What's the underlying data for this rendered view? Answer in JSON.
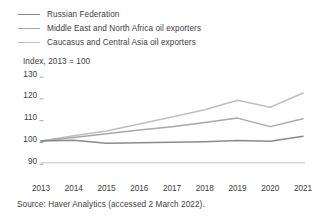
{
  "legend": {
    "position": "top-left",
    "items": [
      {
        "label": "Russian Federation",
        "color": "#8a8a8a"
      },
      {
        "label": "Middle East and North Africa oil exporters",
        "color": "#a8a8a8"
      },
      {
        "label": "Caucasus and Central Asia oil exporters",
        "color": "#bfbfbf"
      }
    ]
  },
  "source": {
    "text": "Source: Haver Analytics (accessed 2 March 2022)."
  },
  "chart_data": {
    "type": "line",
    "title": "Index,  2013 = 100",
    "xlabel": "",
    "ylabel": "",
    "x": [
      2013,
      2014,
      2015,
      2016,
      2017,
      2018,
      2019,
      2020,
      2021
    ],
    "categories": [
      "2013",
      "2014",
      "2015",
      "2016",
      "2017",
      "2018",
      "2019",
      "2020",
      "2021"
    ],
    "ylim": [
      90,
      130
    ],
    "yticks": [
      90,
      100,
      110,
      120,
      130
    ],
    "ytick_labels": [
      "90",
      "100",
      "110",
      "120",
      "130"
    ],
    "xlim": [
      2013,
      2021
    ],
    "grid": false,
    "legend_position": "above-plot",
    "series": [
      {
        "name": "Russian Federation",
        "color": "#8a8a8a",
        "values": [
          100.0,
          100.3,
          99.0,
          99.2,
          99.4,
          99.7,
          100.2,
          99.9,
          102.2
        ]
      },
      {
        "name": "Middle East and North Africa oil exporters",
        "color": "#a8a8a8",
        "values": [
          100.0,
          101.6,
          103.3,
          105.0,
          106.5,
          108.5,
          110.5,
          106.6,
          110.2
        ]
      },
      {
        "name": "Caucasus and Central Asia oil exporters",
        "color": "#bfbfbf",
        "values": [
          100.0,
          102.4,
          104.6,
          107.8,
          111.0,
          114.3,
          118.7,
          115.5,
          122.0
        ]
      }
    ]
  }
}
